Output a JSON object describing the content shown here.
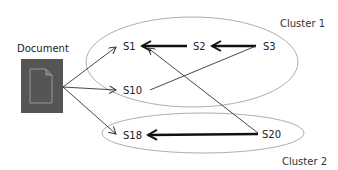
{
  "document": {
    "label": "Document",
    "box_color": "#555555",
    "icon": "file-icon"
  },
  "clusters": [
    {
      "id": "cluster1",
      "label": "Cluster 1",
      "nodes": [
        "S1",
        "S2",
        "S3",
        "S10"
      ]
    },
    {
      "id": "cluster2",
      "label": "Cluster 2",
      "nodes": [
        "S18",
        "S20"
      ]
    }
  ],
  "nodes": [
    {
      "id": "S1",
      "label": "S1"
    },
    {
      "id": "S2",
      "label": "S2"
    },
    {
      "id": "S3",
      "label": "S3"
    },
    {
      "id": "S10",
      "label": "S10"
    },
    {
      "id": "S18",
      "label": "S18"
    },
    {
      "id": "S20",
      "label": "S20"
    }
  ],
  "edges": [
    {
      "from": "Document",
      "to": "S1",
      "weight": "thin"
    },
    {
      "from": "Document",
      "to": "S10",
      "weight": "thin"
    },
    {
      "from": "Document",
      "to": "S18",
      "weight": "thin"
    },
    {
      "from": "S2",
      "to": "S1",
      "weight": "thick"
    },
    {
      "from": "S3",
      "to": "S2",
      "weight": "thick"
    },
    {
      "from": "S20",
      "to": "S18",
      "weight": "thick"
    },
    {
      "from": "S20",
      "to": "S1",
      "weight": "thin"
    },
    {
      "from": "S10",
      "to": "S3",
      "weight": "thin"
    }
  ]
}
